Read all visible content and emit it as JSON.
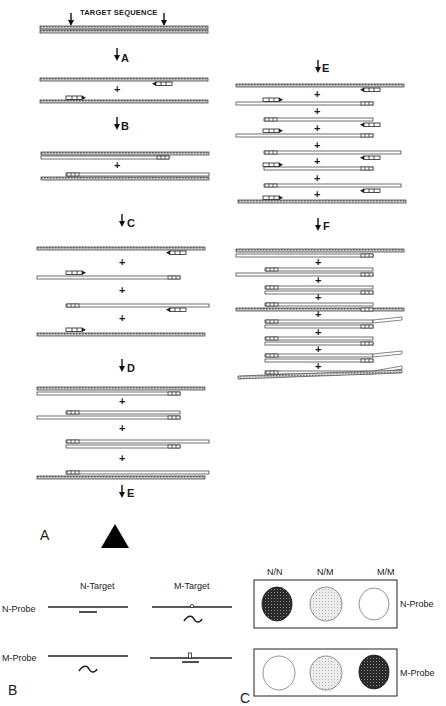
{
  "panel_a": {
    "label": "A",
    "title": "TARGET SEQUENCE",
    "steps_left": [
      "A",
      "B",
      "C",
      "D",
      "E"
    ],
    "steps_right": [
      "E",
      "F"
    ],
    "plus_sign": "+"
  },
  "panel_b": {
    "label": "B",
    "column_headers": [
      "N-Target",
      "M-Target"
    ],
    "row_labels": [
      "N-Probe",
      "M-Probe"
    ]
  },
  "panel_c": {
    "label": "C",
    "column_headers": [
      "N/N",
      "N/M",
      "M/M"
    ],
    "row_labels": [
      "N-Probe",
      "M-Probe"
    ],
    "rows": [
      {
        "probe": "N-Probe",
        "signals": [
          "strong",
          "medium",
          "none"
        ]
      },
      {
        "probe": "M-Probe",
        "signals": [
          "none",
          "medium",
          "strong"
        ]
      }
    ],
    "colors": {
      "strong": "#3a3a3a",
      "medium": "#dcdcdc",
      "none": "#ffffff"
    }
  }
}
